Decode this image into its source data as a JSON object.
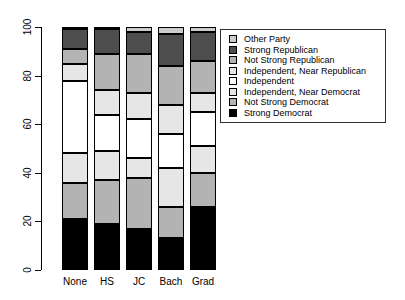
{
  "chart_data": {
    "type": "bar",
    "stacked": true,
    "title": "",
    "xlabel": "",
    "ylabel": "",
    "ylim": [
      0,
      100
    ],
    "yticks": [
      0,
      20,
      40,
      60,
      80,
      100
    ],
    "grid": false,
    "legend_position": "top-right-inside",
    "categories": [
      "None",
      "HS",
      "JC",
      "Bach",
      "Grad"
    ],
    "series": [
      {
        "name": "Strong Democrat",
        "color": "#000000",
        "values": [
          21,
          19,
          17,
          13,
          26
        ]
      },
      {
        "name": "Not Strong Democrat",
        "color": "#b3b3b3",
        "values": [
          15,
          18,
          21,
          13,
          14
        ]
      },
      {
        "name": "Independent, Near Democrat",
        "color": "#e6e6e6",
        "values": [
          12,
          12,
          8,
          16,
          11
        ]
      },
      {
        "name": "Independent",
        "color": "#ffffff",
        "values": [
          30,
          15,
          16,
          14,
          14
        ]
      },
      {
        "name": "Independent, Near Republican",
        "color": "#e6e6e6",
        "values": [
          7,
          10,
          11,
          12,
          8
        ]
      },
      {
        "name": "Not Strong Republican",
        "color": "#b3b3b3",
        "values": [
          6,
          15,
          16,
          16,
          13
        ]
      },
      {
        "name": "Strong Republican",
        "color": "#4d4d4d",
        "values": [
          8,
          10,
          9,
          13,
          12
        ]
      },
      {
        "name": "Other Party",
        "color": "#cccccc",
        "values": [
          1,
          1,
          2,
          3,
          2
        ]
      }
    ],
    "legend_order_top_to_bottom": [
      "Other Party",
      "Strong Republican",
      "Not Strong Republican",
      "Independent, Near Republican",
      "Independent",
      "Independent, Near Democrat",
      "Not Strong Democrat",
      "Strong Democrat"
    ]
  },
  "layout_colors": {
    "background": "#ffffff",
    "axis": "#000000",
    "bar_border": "#000000",
    "legend_border": "#333333"
  }
}
